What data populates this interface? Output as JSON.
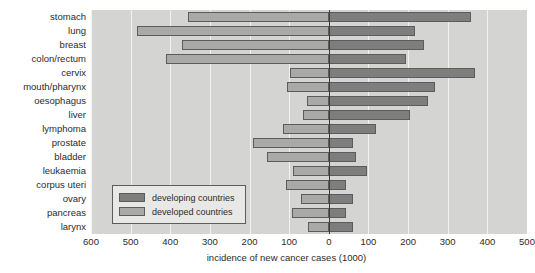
{
  "chart_data": {
    "type": "bar",
    "orientation": "horizontal",
    "layout": "diverging-population-pyramid",
    "title": "",
    "xlabel": "incidence of new cancer cases (1000)",
    "ylabel": "",
    "xlim": [
      -600,
      500
    ],
    "xtick_values": [
      -600,
      -500,
      -400,
      -300,
      -200,
      -100,
      0,
      100,
      200,
      300,
      400,
      500
    ],
    "xtick_labels": [
      "600",
      "500",
      "400",
      "300",
      "200",
      "100",
      "0",
      "100",
      "200",
      "300",
      "400",
      "500"
    ],
    "grid": true,
    "grid_axis": "x",
    "legend_position": "lower-left-inside",
    "categories": [
      "stomach",
      "lung",
      "breast",
      "colon/rectum",
      "cervix",
      "mouth/pharynx",
      "oesophagus",
      "liver",
      "lymphoma",
      "prostate",
      "bladder",
      "leukaemia",
      "corpus uteri",
      "ovary",
      "pancreas",
      "larynx"
    ],
    "series": [
      {
        "name": "developing countries",
        "color": "#7e7e7e",
        "side": "right",
        "values": [
          359,
          218,
          241,
          194,
          368,
          268,
          250,
          206,
          118,
          62,
          68,
          97,
          44,
          62,
          44,
          62
        ]
      },
      {
        "name": "developed countries",
        "color": "#a9a9a7",
        "side": "left",
        "values": [
          356,
          485,
          370,
          411,
          97,
          106,
          56,
          65,
          115,
          191,
          156,
          91,
          109,
          71,
          94,
          53
        ]
      }
    ],
    "legend": [
      {
        "label": "developing countries",
        "swatch": "developing"
      },
      {
        "label": "developed countries",
        "swatch": "developed"
      }
    ]
  },
  "colors": {
    "plot_background": "#d4d4d2",
    "gridline": "#f2f2f0",
    "zeroline": "#3b3b3b",
    "developing": "#7e7e7e",
    "developed": "#a9a9a7",
    "bar_outline": "#5c5c5c",
    "text": "#2b2b2b"
  }
}
